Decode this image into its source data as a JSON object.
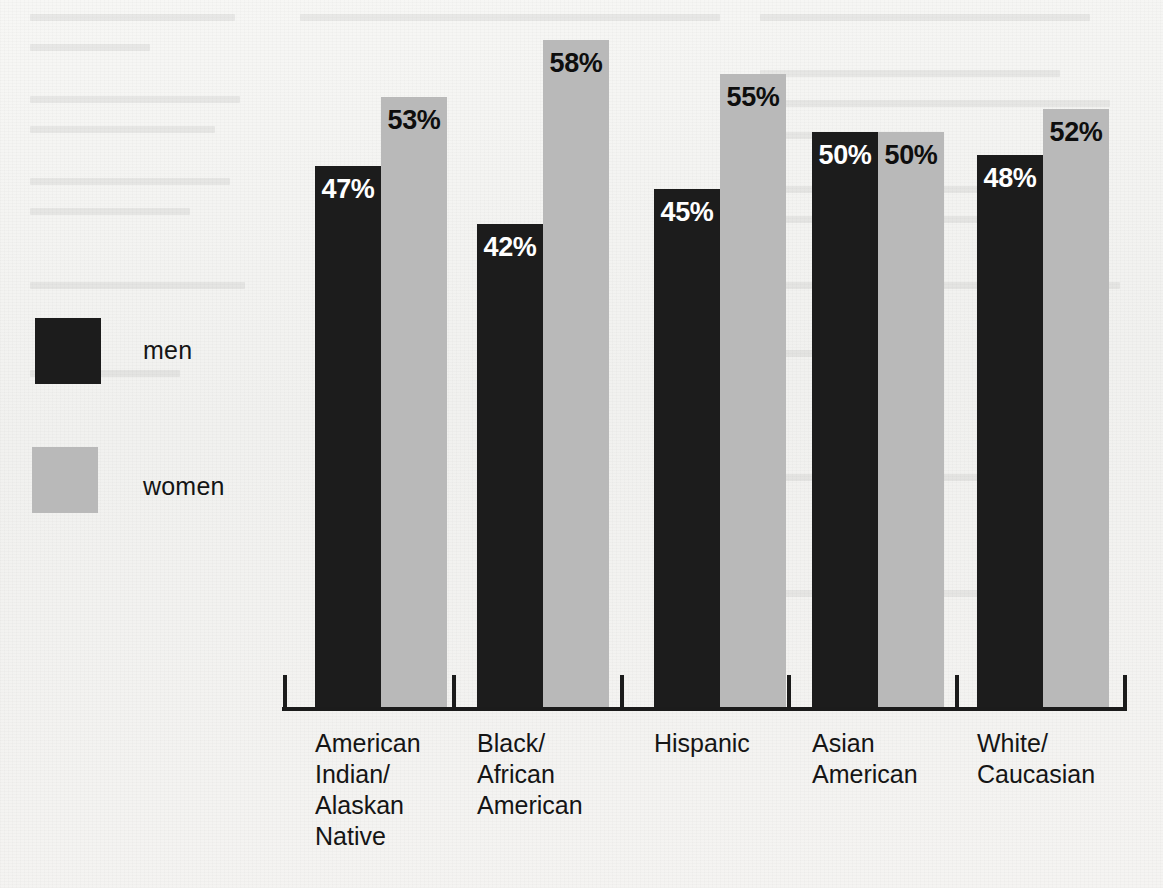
{
  "chart_data": {
    "type": "bar",
    "title": "",
    "subtitle": "",
    "xlabel": "",
    "ylabel": "",
    "ylim": [
      0,
      62
    ],
    "grid": false,
    "legend_position": "left",
    "value_suffix": "%",
    "categories": [
      "American\nIndian/\nAlaskan\nNative",
      "Black/\nAfrican\nAmerican",
      "Hispanic",
      "Asian\nAmerican",
      "White/\nCaucasian"
    ],
    "series": [
      {
        "name": "men",
        "color": "#1c1c1c",
        "values": [
          47,
          42,
          45,
          50,
          48
        ],
        "labels": [
          "47%",
          "42%",
          "45%",
          "50%",
          "48%"
        ]
      },
      {
        "name": "women",
        "color": "#b9b9b9",
        "values": [
          53,
          58,
          55,
          50,
          52
        ],
        "labels": [
          "53%",
          "58%",
          "55%",
          "50%",
          "52%"
        ]
      }
    ]
  },
  "legend": {
    "items": [
      {
        "label": "men",
        "color": "#1c1c1c"
      },
      {
        "label": "women",
        "color": "#b9b9b9"
      }
    ]
  },
  "axis": {
    "line_color": "#1b1b1b",
    "tick_count": 6
  },
  "colors": {
    "men": "#1c1c1c",
    "women": "#b9b9b9",
    "background": "#f3f3f1",
    "text": "#151515",
    "value_on_dark": "#ffffff",
    "value_on_light": "#0e0e0e"
  }
}
